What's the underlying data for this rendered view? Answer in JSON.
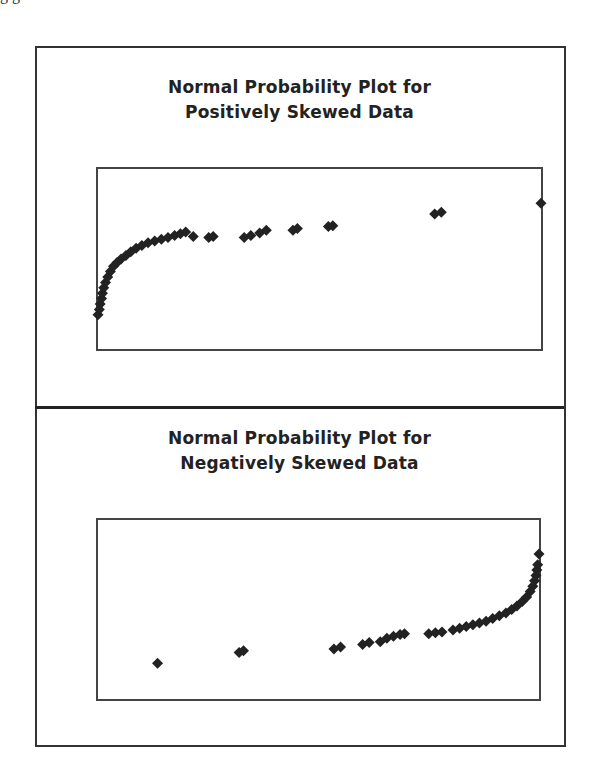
{
  "page": {
    "cut_off_text": "g                 g"
  },
  "chart_data": [
    {
      "type": "scatter",
      "title": "Normal Probability Plot for Positively Skewed Data",
      "title_lines": [
        "Normal Probability Plot for",
        "Positively Skewed Data"
      ],
      "xlabel": "",
      "ylabel": "",
      "grid": false,
      "legend": "none",
      "axes_ticks": "none",
      "xlim": [
        0,
        100
      ],
      "ylim": [
        0,
        100
      ],
      "marker": "diamond",
      "marker_color": "#222222",
      "points": [
        [
          0,
          19
        ],
        [
          0.3,
          22
        ],
        [
          0.5,
          25
        ],
        [
          0.8,
          28
        ],
        [
          1,
          31
        ],
        [
          1.3,
          34
        ],
        [
          1.7,
          37
        ],
        [
          2.2,
          40
        ],
        [
          2.8,
          43
        ],
        [
          3.5,
          46
        ],
        [
          4.3,
          48
        ],
        [
          5.2,
          50
        ],
        [
          6.3,
          52
        ],
        [
          7.4,
          54
        ],
        [
          8.6,
          56
        ],
        [
          9.9,
          57.5
        ],
        [
          11.3,
          59
        ],
        [
          12.8,
          60
        ],
        [
          14.3,
          61
        ],
        [
          15.8,
          62
        ],
        [
          17.3,
          63
        ],
        [
          18.6,
          64
        ],
        [
          19.8,
          65
        ],
        [
          21.5,
          62.5
        ],
        [
          25,
          62
        ],
        [
          26,
          62.5
        ],
        [
          33,
          62
        ],
        [
          34.5,
          63
        ],
        [
          36.5,
          64.5
        ],
        [
          38,
          66
        ],
        [
          44,
          66
        ],
        [
          45,
          67
        ],
        [
          52,
          68
        ],
        [
          53,
          68.5
        ],
        [
          76,
          75
        ],
        [
          77.5,
          76
        ],
        [
          100,
          81
        ]
      ]
    },
    {
      "type": "scatter",
      "title": "Normal Probability Plot for Negatively Skewed Data",
      "title_lines": [
        "Normal Probability Plot for",
        "Negatively Skewed Data"
      ],
      "xlabel": "",
      "ylabel": "",
      "grid": false,
      "legend": "none",
      "axes_ticks": "none",
      "xlim": [
        0,
        100
      ],
      "ylim": [
        0,
        100
      ],
      "marker": "diamond",
      "marker_color": "#222222",
      "points": [
        [
          13.5,
          20
        ],
        [
          32,
          26
        ],
        [
          33,
          27
        ],
        [
          53.5,
          28
        ],
        [
          55,
          29
        ],
        [
          60,
          30.5
        ],
        [
          61.5,
          31.5
        ],
        [
          64,
          32
        ],
        [
          65.5,
          34
        ],
        [
          67,
          35
        ],
        [
          68.5,
          36
        ],
        [
          69.5,
          36.5
        ],
        [
          75,
          36.5
        ],
        [
          76.5,
          37
        ],
        [
          78,
          37.5
        ],
        [
          80.5,
          38.5
        ],
        [
          82,
          39.5
        ],
        [
          83.5,
          40.5
        ],
        [
          85,
          41.5
        ],
        [
          86.5,
          42.5
        ],
        [
          88,
          43.5
        ],
        [
          89.5,
          45
        ],
        [
          91,
          46.5
        ],
        [
          92.5,
          48
        ],
        [
          93.8,
          50
        ],
        [
          95,
          52
        ],
        [
          96.2,
          54.5
        ],
        [
          97.2,
          57
        ],
        [
          98,
          60
        ],
        [
          98.6,
          63
        ],
        [
          99,
          66
        ],
        [
          99.3,
          69
        ],
        [
          99.5,
          72
        ],
        [
          99.7,
          75
        ],
        [
          100,
          81
        ]
      ]
    }
  ]
}
